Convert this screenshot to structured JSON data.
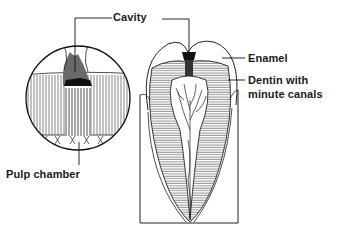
{
  "diagram": {
    "labels": {
      "cavity": "Cavity",
      "enamel": "Enamel",
      "dentin_line1": "Dentin with",
      "dentin_line2": "minute canals",
      "pulp_chamber": "Pulp chamber"
    },
    "panels": [
      {
        "name": "magnified-circle-view",
        "shape": "circle"
      },
      {
        "name": "tooth-longitudinal-section",
        "shape": "tooth"
      }
    ],
    "colors": {
      "ink": "#1a1a1a",
      "background": "#ffffff"
    }
  }
}
